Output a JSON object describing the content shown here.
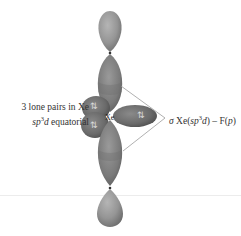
{
  "diagram": {
    "central_atom": "Xe",
    "lone_pair_arrow": "⇅",
    "left_label": {
      "line1_prefix": "3 lone pairs in Xe",
      "line2_italic": "sp",
      "line2_sup": "3",
      "line2_italic_d": "d",
      "line2_suffix": " equatorial"
    },
    "right_label": {
      "sigma": "σ",
      "text_prefix": " Xe(",
      "sp": "sp",
      "sup": "3",
      "d": "d",
      "text_mid": ") – F(",
      "p": "p",
      "text_end": ")"
    },
    "colors": {
      "lobe_light": "#9a9a9a",
      "lobe_mid": "#7d7d7d",
      "lobe_dark": "#5e5e5e",
      "connector_line": "#9c9c9c",
      "background": "#ffffff"
    }
  }
}
